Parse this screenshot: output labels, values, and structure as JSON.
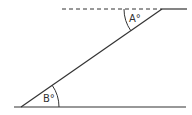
{
  "diagram": {
    "type": "parallel-lines-transversal",
    "angles": [
      {
        "id": "A",
        "label": "A°",
        "position": "top-vertex, between dashed extension and transversal"
      },
      {
        "id": "B",
        "label": "B°",
        "position": "bottom-vertex, between bottom line and transversal"
      }
    ],
    "labels": {
      "angle_a": "A°",
      "angle_b": "B°"
    },
    "colors": {
      "line": "#333333",
      "background": "#ffffff"
    }
  }
}
